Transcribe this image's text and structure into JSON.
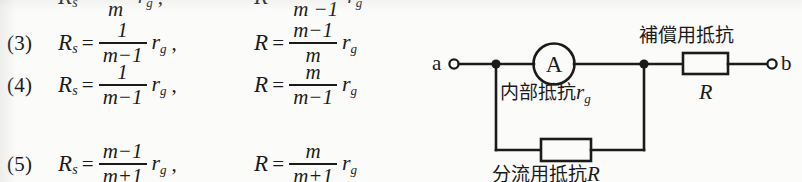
{
  "document": {
    "type": "textbook-page-excerpt",
    "language": "ja",
    "ink_color": "#1b1b1b",
    "paper_color": "#fbfbfa"
  },
  "equations": {
    "clipped_top_row": {
      "left_denominator": "m",
      "right_denominator": "m −1",
      "note": "partially visible denominators of the row above"
    },
    "rows": [
      {
        "number": "(3)",
        "left": {
          "lhs": "R",
          "lhs_sub": "s",
          "equals": "=",
          "numerator": "1",
          "denominator": "m−1",
          "factor": "r",
          "factor_sub": "g",
          "trailing": ","
        },
        "right": {
          "lhs": "R",
          "lhs_sub": "",
          "equals": "=",
          "numerator": "m−1",
          "denominator": "m",
          "factor": "r",
          "factor_sub": "g",
          "trailing": ""
        }
      },
      {
        "number": "(4)",
        "left": {
          "lhs": "R",
          "lhs_sub": "s",
          "equals": "=",
          "numerator": "1",
          "denominator": "m−1",
          "factor": "r",
          "factor_sub": "g",
          "trailing": ","
        },
        "right": {
          "lhs": "R",
          "lhs_sub": "",
          "equals": "=",
          "numerator": "m",
          "denominator": "m−1",
          "factor": "r",
          "factor_sub": "g",
          "trailing": ""
        }
      },
      {
        "number": "(5)",
        "left": {
          "lhs": "R",
          "lhs_sub": "s",
          "equals": "=",
          "numerator": "m−1",
          "denominator": "m+1",
          "factor": "r",
          "factor_sub": "g",
          "trailing": ","
        },
        "right": {
          "lhs": "R",
          "lhs_sub": "",
          "equals": "=",
          "numerator": "m",
          "denominator": "m+1",
          "factor": "r",
          "factor_sub": "g",
          "trailing": ""
        }
      }
    ]
  },
  "circuit": {
    "terminal_a": "a",
    "terminal_b": "b",
    "ammeter_symbol": "A",
    "label_compensating_resistor": "補償用抵抗",
    "label_R": "R",
    "label_internal_resistance_text": "内部抵抗",
    "label_internal_resistance_symbol": "r",
    "label_internal_resistance_sub": "g",
    "label_shunt_text": "分流用抵抗",
    "label_shunt_symbol": "R"
  }
}
